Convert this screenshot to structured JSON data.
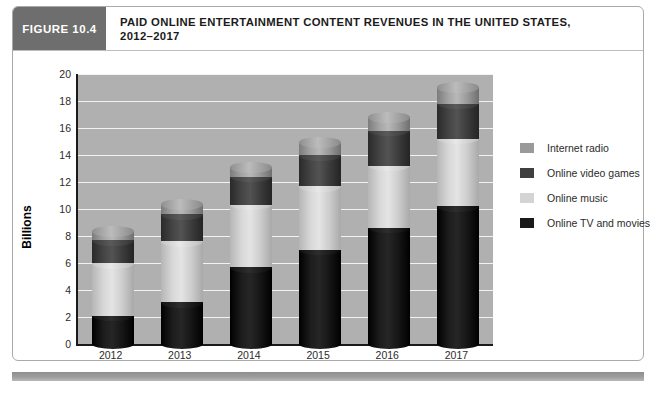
{
  "figure": {
    "tag": "FIGURE 10.4",
    "title_line1": "PAID ONLINE ENTERTAINMENT CONTENT REVENUES IN THE UNITED STATES,",
    "title_line2": "2012–2017"
  },
  "chart_data": {
    "type": "bar",
    "stacked": true,
    "title": "PAID ONLINE ENTERTAINMENT CONTENT REVENUES IN THE UNITED STATES, 2012–2017",
    "xlabel": "",
    "ylabel": "Billions",
    "categories": [
      "2012",
      "2013",
      "2014",
      "2015",
      "2016",
      "2017"
    ],
    "ylim": [
      0,
      20
    ],
    "yticks": [
      "0",
      "2",
      "4",
      "6",
      "8",
      "10",
      "12",
      "14",
      "16",
      "18",
      "20"
    ],
    "grid": true,
    "legend_position": "right",
    "series": [
      {
        "name": "Online TV and movies",
        "color": "#1a1a1a",
        "values": [
          2.1,
          3.1,
          5.7,
          7.0,
          8.6,
          10.2
        ]
      },
      {
        "name": "Online music",
        "color": "#d4d4d4",
        "values": [
          3.9,
          4.5,
          4.6,
          4.7,
          4.6,
          5.0
        ]
      },
      {
        "name": "Online video games",
        "color": "#3f3f3f",
        "values": [
          1.7,
          2.0,
          2.1,
          2.3,
          2.6,
          2.6
        ]
      },
      {
        "name": "Internet radio",
        "color": "#9a9a9a",
        "values": [
          0.6,
          0.7,
          0.7,
          0.9,
          1.0,
          1.2
        ]
      }
    ],
    "totals": [
      8.3,
      10.3,
      13.1,
      14.9,
      16.8,
      19.0
    ],
    "legend_order": [
      "Internet radio",
      "Online video games",
      "Online music",
      "Online TV and movies"
    ]
  },
  "legend": [
    {
      "label": "Internet radio",
      "color": "#9a9a9a",
      "icon": "legend-swatch-icon"
    },
    {
      "label": "Online video games",
      "color": "#3f3f3f",
      "icon": "legend-swatch-icon"
    },
    {
      "label": "Online music",
      "color": "#d4d4d4",
      "icon": "legend-swatch-icon"
    },
    {
      "label": "Online TV and movies",
      "color": "#1a1a1a",
      "icon": "legend-swatch-icon"
    }
  ],
  "colors": {
    "plot_background": "#b0b0b0",
    "gridline": "#f2f2f2",
    "axis": "#1a1a1a",
    "tag_background": "#6e6e6e",
    "card_border": "#a9a9a9",
    "bottom_rule": "#9d9d9d"
  }
}
